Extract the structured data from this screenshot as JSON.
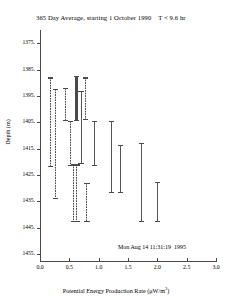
{
  "figure": {
    "title": "365 Day Average, starting 1 October 1990    T < 9.6 hr",
    "timestamp": "Mon Aug 14 11:31:19  1995",
    "xlabel_text": "Potential Energy Production Rate (",
    "xlabel_units": "μW/m",
    "xlabel_exponent": "3",
    "xlabel_close": ")",
    "ylabel": "Depth (m)",
    "colors": {
      "axis": "#4a4a4a",
      "solid_series": "#555555",
      "dashed_series": "#4a4a4a",
      "background": "#ffffff"
    }
  },
  "chart_data": {
    "type": "errorbar",
    "title": "365 Day Average, starting 1 October 1990    T < 9.6 hr",
    "xlabel": "Potential Energy Production Rate (μW/m3)",
    "ylabel": "Depth (m)",
    "xlim": [
      0.0,
      3.0
    ],
    "ylim_top": 1370.0,
    "ylim_bottom": 1458.0,
    "y_inverted": true,
    "grid": false,
    "legend": "none",
    "xticks": [
      0.0,
      0.5,
      1.0,
      1.5,
      2.0,
      2.5,
      3.0
    ],
    "xticklabels": [
      "0.0",
      "0.5",
      "1.0",
      "1.5",
      "2.0",
      "2.5",
      "3.0"
    ],
    "yticks": [
      1375,
      1385,
      1395,
      1405,
      1415,
      1425,
      1435,
      1445,
      1455
    ],
    "yticklabels": [
      "1375.",
      "1385.",
      "1395.",
      "1405.",
      "1415.",
      "1425.",
      "1435.",
      "1445.",
      "1455."
    ],
    "series": [
      {
        "name": "dashed",
        "style": "dashed",
        "linewidth": 1,
        "points": [
          {
            "x": 0.18,
            "y_top": 1388.0,
            "y_bottom": 1422.0
          },
          {
            "x": 0.27,
            "y_top": 1392.5,
            "y_bottom": 1434.0
          },
          {
            "x": 0.43,
            "y_top": 1392.0,
            "y_bottom": 1404.5
          },
          {
            "x": 0.52,
            "y_top": 1404.5,
            "y_bottom": 1421.5
          },
          {
            "x": 0.57,
            "y_top": 1421.0,
            "y_bottom": 1443.0
          },
          {
            "x": 0.63,
            "y_top": 1421.0,
            "y_bottom": 1443.0
          },
          {
            "x": 0.78,
            "y_top": 1388.0,
            "y_bottom": 1404.0
          },
          {
            "x": 0.8,
            "y_top": 1428.0,
            "y_bottom": 1443.0
          }
        ]
      },
      {
        "name": "solid",
        "style": "solid",
        "linewidth": 1,
        "points": [
          {
            "x": 0.62,
            "y_top": 1387.5,
            "y_bottom": 1404.5,
            "thick": true
          },
          {
            "x": 0.7,
            "y_top": 1393.0,
            "y_bottom": 1421.0
          },
          {
            "x": 0.93,
            "y_top": 1404.5,
            "y_bottom": 1421.5
          },
          {
            "x": 1.22,
            "y_top": 1404.5,
            "y_bottom": 1432.0
          },
          {
            "x": 1.37,
            "y_top": 1413.5,
            "y_bottom": 1432.0
          },
          {
            "x": 1.73,
            "y_top": 1413.0,
            "y_bottom": 1443.0
          },
          {
            "x": 2.0,
            "y_top": 1427.5,
            "y_bottom": 1443.0
          }
        ]
      }
    ]
  }
}
